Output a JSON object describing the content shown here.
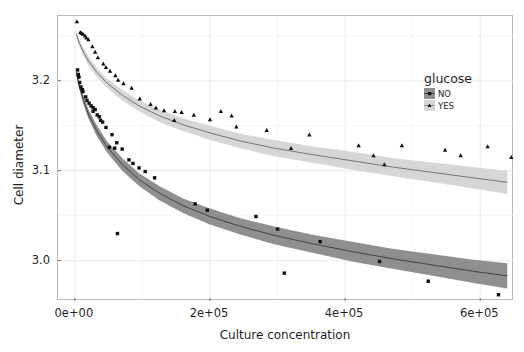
{
  "chart_data": {
    "type": "scatter",
    "title": "",
    "xlabel": "Culture concentration",
    "ylabel": "Cell diameter",
    "xlim": [
      -25000,
      650000
    ],
    "ylim": [
      2.955,
      3.272
    ],
    "xticks": [
      0,
      200000,
      400000,
      600000
    ],
    "xticklabels": [
      "0e+00",
      "2e+05",
      "4e+05",
      "6e+05"
    ],
    "yticks": [
      3.0,
      3.1,
      3.2
    ],
    "yticklabels": [
      "3.0",
      "3.1",
      "3.2"
    ],
    "x_minor_ticks": [
      100000,
      300000,
      500000
    ],
    "y_minor_ticks": [
      2.95,
      3.05,
      3.15,
      3.25
    ],
    "grid": true,
    "legend": {
      "title": "glucose",
      "position": "inside-right-top",
      "entries": [
        {
          "label": "NO",
          "marker": "square",
          "color": "#8f8f8f",
          "line_color": "#3a3a3a"
        },
        {
          "label": "YES",
          "marker": "triangle",
          "color": "#d6d6d6",
          "line_color": "#6a6a6a"
        }
      ]
    },
    "series": [
      {
        "name": "NO",
        "marker": "square",
        "point_color": "#111111",
        "fit_line_color": "#3a3a3a",
        "ribbon_color": "#8f8f8f",
        "fit_type": "logarithmic-decay",
        "fit_points": [
          [
            2000,
            3.21
          ],
          [
            6000,
            3.196
          ],
          [
            12000,
            3.18
          ],
          [
            20000,
            3.163
          ],
          [
            32000,
            3.145
          ],
          [
            48000,
            3.126
          ],
          [
            70000,
            3.107
          ],
          [
            95000,
            3.09
          ],
          [
            125000,
            3.075
          ],
          [
            160000,
            3.061
          ],
          [
            200000,
            3.049
          ],
          [
            245000,
            3.038
          ],
          [
            295000,
            3.028
          ],
          [
            350000,
            3.019
          ],
          [
            410000,
            3.01
          ],
          [
            470000,
            3.002
          ],
          [
            530000,
            2.995
          ],
          [
            590000,
            2.988
          ],
          [
            640000,
            2.983
          ]
        ],
        "ribbon_halfwidth": [
          0.004,
          0.004,
          0.005,
          0.005,
          0.006,
          0.006,
          0.007,
          0.007,
          0.008,
          0.008,
          0.009,
          0.009,
          0.01,
          0.01,
          0.011,
          0.011,
          0.012,
          0.013,
          0.014
        ],
        "points": [
          [
            4000,
            3.212
          ],
          [
            5000,
            3.207
          ],
          [
            6000,
            3.204
          ],
          [
            7000,
            3.198
          ],
          [
            9000,
            3.193
          ],
          [
            12000,
            3.188
          ],
          [
            16000,
            3.182
          ],
          [
            11000,
            3.19
          ],
          [
            21000,
            3.175
          ],
          [
            27000,
            3.17
          ],
          [
            30000,
            3.168
          ],
          [
            24000,
            3.172
          ],
          [
            36000,
            3.16
          ],
          [
            41000,
            3.154
          ],
          [
            46000,
            3.148
          ],
          [
            55000,
            3.14
          ],
          [
            27000,
            3.166
          ],
          [
            33000,
            3.162
          ],
          [
            18000,
            3.178
          ],
          [
            38000,
            3.156
          ],
          [
            62000,
            3.131
          ],
          [
            70000,
            3.124
          ],
          [
            51000,
            3.126
          ],
          [
            59000,
            3.125
          ],
          [
            86000,
            3.108
          ],
          [
            95000,
            3.103
          ],
          [
            80000,
            3.112
          ],
          [
            104000,
            3.099
          ],
          [
            118000,
            3.092
          ],
          [
            63000,
            3.03
          ],
          [
            178000,
            3.063
          ],
          [
            196000,
            3.056
          ],
          [
            268000,
            3.049
          ],
          [
            300000,
            3.035
          ],
          [
            310000,
            2.986
          ],
          [
            363000,
            3.021
          ],
          [
            451000,
            2.999
          ],
          [
            523000,
            2.977
          ],
          [
            627000,
            2.962
          ]
        ]
      },
      {
        "name": "YES",
        "marker": "triangle",
        "point_color": "#111111",
        "fit_line_color": "#6a6a6a",
        "ribbon_color": "#d6d6d6",
        "fit_type": "logarithmic-decay",
        "fit_points": [
          [
            2000,
            3.252
          ],
          [
            6000,
            3.243
          ],
          [
            12000,
            3.233
          ],
          [
            20000,
            3.222
          ],
          [
            32000,
            3.21
          ],
          [
            48000,
            3.197
          ],
          [
            70000,
            3.184
          ],
          [
            95000,
            3.172
          ],
          [
            125000,
            3.161
          ],
          [
            160000,
            3.151
          ],
          [
            200000,
            3.142
          ],
          [
            245000,
            3.133
          ],
          [
            295000,
            3.125
          ],
          [
            350000,
            3.118
          ],
          [
            410000,
            3.111
          ],
          [
            470000,
            3.104
          ],
          [
            530000,
            3.098
          ],
          [
            590000,
            3.092
          ],
          [
            640000,
            3.087
          ]
        ],
        "ribbon_halfwidth": [
          0.004,
          0.004,
          0.004,
          0.005,
          0.005,
          0.005,
          0.006,
          0.006,
          0.007,
          0.007,
          0.008,
          0.008,
          0.009,
          0.009,
          0.01,
          0.01,
          0.011,
          0.012,
          0.013
        ],
        "points": [
          [
            3000,
            3.266
          ],
          [
            8000,
            3.254
          ],
          [
            12000,
            3.252
          ],
          [
            15000,
            3.25
          ],
          [
            10000,
            3.253
          ],
          [
            20000,
            3.246
          ],
          [
            17000,
            3.248
          ],
          [
            26000,
            3.238
          ],
          [
            34000,
            3.226
          ],
          [
            30000,
            3.232
          ],
          [
            42000,
            3.219
          ],
          [
            52000,
            3.211
          ],
          [
            60000,
            3.206
          ],
          [
            46000,
            3.215
          ],
          [
            72000,
            3.197
          ],
          [
            84000,
            3.192
          ],
          [
            64000,
            3.201
          ],
          [
            96000,
            3.18
          ],
          [
            112000,
            3.174
          ],
          [
            120000,
            3.17
          ],
          [
            132000,
            3.167
          ],
          [
            148000,
            3.166
          ],
          [
            158000,
            3.165
          ],
          [
            176000,
            3.162
          ],
          [
            147000,
            3.156
          ],
          [
            200000,
            3.157
          ],
          [
            216000,
            3.166
          ],
          [
            232000,
            3.161
          ],
          [
            239000,
            3.149
          ],
          [
            284000,
            3.145
          ],
          [
            320000,
            3.125
          ],
          [
            347000,
            3.14
          ],
          [
            420000,
            3.128
          ],
          [
            442000,
            3.117
          ],
          [
            458000,
            3.107
          ],
          [
            484000,
            3.128
          ],
          [
            548000,
            3.123
          ],
          [
            571000,
            3.117
          ],
          [
            611000,
            3.127
          ],
          [
            646000,
            3.115
          ]
        ]
      }
    ]
  },
  "axes": {
    "x_title": "Culture concentration",
    "y_title": "Cell diameter"
  },
  "legend": {
    "title": "glucose",
    "no_label": "NO",
    "yes_label": "YES"
  },
  "colors": {
    "panel_border": "#b9b9b9",
    "grid_major": "#ececec",
    "grid_minor": "#f5f5f5",
    "no_ribbon": "#8f8f8f",
    "yes_ribbon": "#d6d6d6",
    "no_line": "#3a3a3a",
    "yes_line": "#6a6a6a",
    "point": "#111111"
  }
}
